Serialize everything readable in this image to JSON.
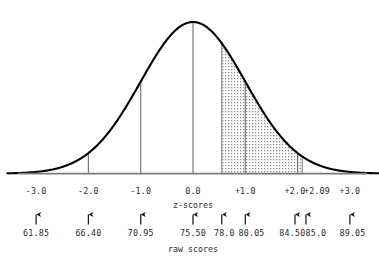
{
  "figure": {
    "title": "",
    "axis_captions": {
      "z": "z-scores",
      "raw": "raw scores"
    }
  },
  "chart_data": {
    "type": "area",
    "title": "",
    "subtitle": "",
    "xlabel": "z-scores",
    "ylabel": "",
    "secondary_xlabel": "raw scores",
    "grid": false,
    "legend": null,
    "distribution": "normal",
    "mean_z": 0.0,
    "mean_raw": 75.5,
    "sd_raw": 4.55,
    "xlim_z": [
      -3.5,
      3.5
    ],
    "z_ticks": [
      "-3.0",
      "-2.0",
      "-1.0",
      "0.0",
      "+1.0",
      "+2.0",
      "+2.09",
      "+3.0"
    ],
    "z_tick_values": [
      -3.0,
      -2.0,
      -1.0,
      0.0,
      1.0,
      2.0,
      2.09,
      3.0
    ],
    "raw_ticks": [
      "61.85",
      "66.40",
      "70.95",
      "75.50",
      "78.0",
      "80.05",
      "84.50",
      "85.0",
      "89.05"
    ],
    "raw_tick_values": [
      61.85,
      66.4,
      70.95,
      75.5,
      78.0,
      80.05,
      84.5,
      85.0,
      89.05
    ],
    "arrow_z_positions": [
      -3.0,
      -2.0,
      -1.0,
      0.0,
      0.55,
      1.0,
      2.0,
      2.09,
      3.0
    ],
    "gridline_z": [
      -3.0,
      -2.0,
      -1.0,
      0.0,
      1.0,
      2.0,
      3.0
    ],
    "shaded_region": {
      "z_start": 0.55,
      "z_end": 2.09,
      "raw_start": 78.0,
      "raw_end": 85.0,
      "fill": "stipple",
      "fill_color": "#d9d9d9"
    },
    "curve_color": "#000000",
    "axis_color": "#808080"
  },
  "z_labels": [
    {
      "text": "-3.0",
      "z": -3.0
    },
    {
      "text": "-2.0",
      "z": -2.0
    },
    {
      "text": "-1.0",
      "z": -1.0
    },
    {
      "text": "0.0",
      "z": 0.0
    },
    {
      "text": "+1.0",
      "z": 1.0
    },
    {
      "text": "+2.0",
      "z": 1.95
    },
    {
      "text": "+2.09",
      "z": 2.37
    },
    {
      "text": "+3.0",
      "z": 3.0
    }
  ],
  "raw_labels": [
    {
      "text": "61.85",
      "z": -3.0
    },
    {
      "text": "66.40",
      "z": -2.0
    },
    {
      "text": "70.95",
      "z": -1.0
    },
    {
      "text": "75.50",
      "z": 0.0
    },
    {
      "text": "78.0",
      "z": 0.6
    },
    {
      "text": "80.05",
      "z": 1.12
    },
    {
      "text": "84.50",
      "z": 1.9
    },
    {
      "text": "85.0",
      "z": 2.35
    },
    {
      "text": "89.05",
      "z": 3.05
    }
  ],
  "arrows": [
    {
      "z": -3.0
    },
    {
      "z": -2.0
    },
    {
      "z": -1.0
    },
    {
      "z": 0.0
    },
    {
      "z": 0.55
    },
    {
      "z": 1.0
    },
    {
      "z": 1.95
    },
    {
      "z": 2.16
    },
    {
      "z": 3.0
    }
  ],
  "colors": {
    "curve": "#000000",
    "axis": "#7a7a7a",
    "shade": "#d7d7d7",
    "text": "#2b2b2b"
  }
}
